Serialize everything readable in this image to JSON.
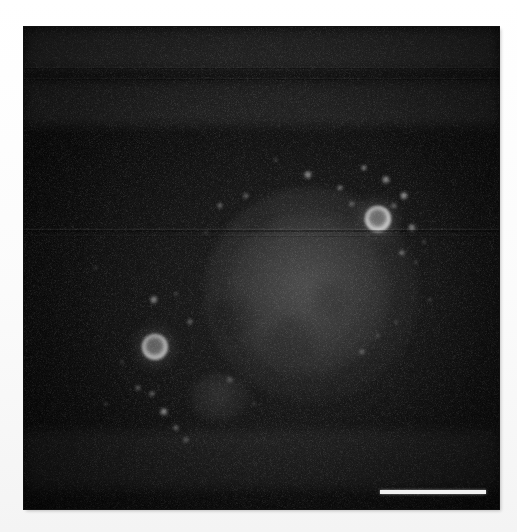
{
  "figure": {
    "kind": "fluorescence-micrograph",
    "caption": "",
    "width_px": 517,
    "height_px": 532,
    "background_color": "#ffffff",
    "plate": {
      "left_px": 24,
      "top_px": 27,
      "width_px": 475,
      "height_px": 482,
      "field_color": "#0a0a0a",
      "border_color": "#111111"
    }
  },
  "scale_bar": {
    "label": "",
    "visible": true,
    "color": "#f2f2f2",
    "left_px": 380,
    "top_px": 490,
    "length_px": 106,
    "thickness_px": 4
  },
  "structures": {
    "cell_bodies": [
      {
        "name": "primary-cell-body",
        "cx": 287,
        "cy": 268,
        "rx": 108,
        "ry": 108,
        "intensity": 0.5,
        "color": "#5c5c5c"
      },
      {
        "name": "secondary-cell-body",
        "cx": 196,
        "cy": 370,
        "rx": 31,
        "ry": 25,
        "intensity": 0.4,
        "color": "#505050"
      }
    ],
    "vacuoles": [
      {
        "cx": 232,
        "cy": 318,
        "r": 22,
        "intensity": 0.46
      },
      {
        "cx": 292,
        "cy": 340,
        "r": 24,
        "intensity": 0.34
      },
      {
        "cx": 330,
        "cy": 300,
        "r": 18,
        "intensity": 0.3
      },
      {
        "cx": 262,
        "cy": 222,
        "r": 16,
        "intensity": 0.24
      }
    ],
    "vesicles": [
      {
        "name": "vesicle-upper-right",
        "cx": 378,
        "cy": 219,
        "r": 13,
        "ring_color": "#cfcfcf",
        "core_color": "#6e6e6e",
        "intensity": 0.92
      },
      {
        "name": "vesicle-lower-left",
        "cx": 155,
        "cy": 347,
        "r": 13,
        "ring_color": "#bcbcbc",
        "core_color": "#5e5e5e",
        "intensity": 0.8
      }
    ],
    "puncta": [
      {
        "cx": 308,
        "cy": 175,
        "r": 4.0,
        "i": 0.72
      },
      {
        "cx": 340,
        "cy": 188,
        "r": 3.2,
        "i": 0.6
      },
      {
        "cx": 364,
        "cy": 168,
        "r": 3.4,
        "i": 0.66
      },
      {
        "cx": 386,
        "cy": 180,
        "r": 3.8,
        "i": 0.7
      },
      {
        "cx": 404,
        "cy": 196,
        "r": 4.4,
        "i": 0.74
      },
      {
        "cx": 394,
        "cy": 206,
        "r": 2.8,
        "i": 0.52
      },
      {
        "cx": 352,
        "cy": 204,
        "r": 2.6,
        "i": 0.48
      },
      {
        "cx": 412,
        "cy": 228,
        "r": 3.6,
        "i": 0.62
      },
      {
        "cx": 402,
        "cy": 253,
        "r": 3.4,
        "i": 0.58
      },
      {
        "cx": 424,
        "cy": 242,
        "r": 2.4,
        "i": 0.44
      },
      {
        "cx": 416,
        "cy": 262,
        "r": 2.2,
        "i": 0.4
      },
      {
        "cx": 246,
        "cy": 196,
        "r": 2.8,
        "i": 0.46
      },
      {
        "cx": 220,
        "cy": 206,
        "r": 3.2,
        "i": 0.54
      },
      {
        "cx": 206,
        "cy": 232,
        "r": 2.4,
        "i": 0.4
      },
      {
        "cx": 154,
        "cy": 300,
        "r": 3.8,
        "i": 0.66
      },
      {
        "cx": 176,
        "cy": 294,
        "r": 2.4,
        "i": 0.42
      },
      {
        "cx": 190,
        "cy": 322,
        "r": 2.8,
        "i": 0.48
      },
      {
        "cx": 138,
        "cy": 388,
        "r": 2.6,
        "i": 0.44
      },
      {
        "cx": 152,
        "cy": 394,
        "r": 3.0,
        "i": 0.5
      },
      {
        "cx": 164,
        "cy": 412,
        "r": 4.2,
        "i": 0.68
      },
      {
        "cx": 176,
        "cy": 428,
        "r": 3.0,
        "i": 0.52
      },
      {
        "cx": 186,
        "cy": 440,
        "r": 2.6,
        "i": 0.46
      },
      {
        "cx": 122,
        "cy": 362,
        "r": 2.2,
        "i": 0.38
      },
      {
        "cx": 106,
        "cy": 404,
        "r": 2.4,
        "i": 0.4
      },
      {
        "cx": 362,
        "cy": 352,
        "r": 2.8,
        "i": 0.46
      },
      {
        "cx": 378,
        "cy": 336,
        "r": 2.4,
        "i": 0.4
      },
      {
        "cx": 396,
        "cy": 322,
        "r": 2.2,
        "i": 0.36
      },
      {
        "cx": 276,
        "cy": 160,
        "r": 2.4,
        "i": 0.42
      },
      {
        "cx": 230,
        "cy": 380,
        "r": 2.6,
        "i": 0.44
      },
      {
        "cx": 254,
        "cy": 404,
        "r": 2.2,
        "i": 0.36
      },
      {
        "cx": 430,
        "cy": 300,
        "r": 2.0,
        "i": 0.34
      },
      {
        "cx": 96,
        "cy": 268,
        "r": 2.0,
        "i": 0.32
      }
    ],
    "scan_artifacts": [
      {
        "name": "scanline-top-1",
        "y": 68,
        "thickness": 1.4,
        "intensity": 0.3
      },
      {
        "name": "scanline-top-2",
        "y": 79,
        "thickness": 1.2,
        "intensity": 0.26
      },
      {
        "name": "scanline-mid-1",
        "y": 230,
        "thickness": 1.6,
        "intensity": 0.34
      },
      {
        "name": "scanline-mid-2",
        "y": 236,
        "thickness": 1.0,
        "intensity": 0.18
      }
    ],
    "bands": [
      {
        "name": "band-upper",
        "y": 28,
        "height": 42,
        "intensity": 0.1
      },
      {
        "name": "band-upper-mid",
        "y": 80,
        "height": 46,
        "intensity": 0.07
      },
      {
        "name": "band-lower",
        "y": 430,
        "height": 60,
        "intensity": 0.05
      }
    ]
  }
}
